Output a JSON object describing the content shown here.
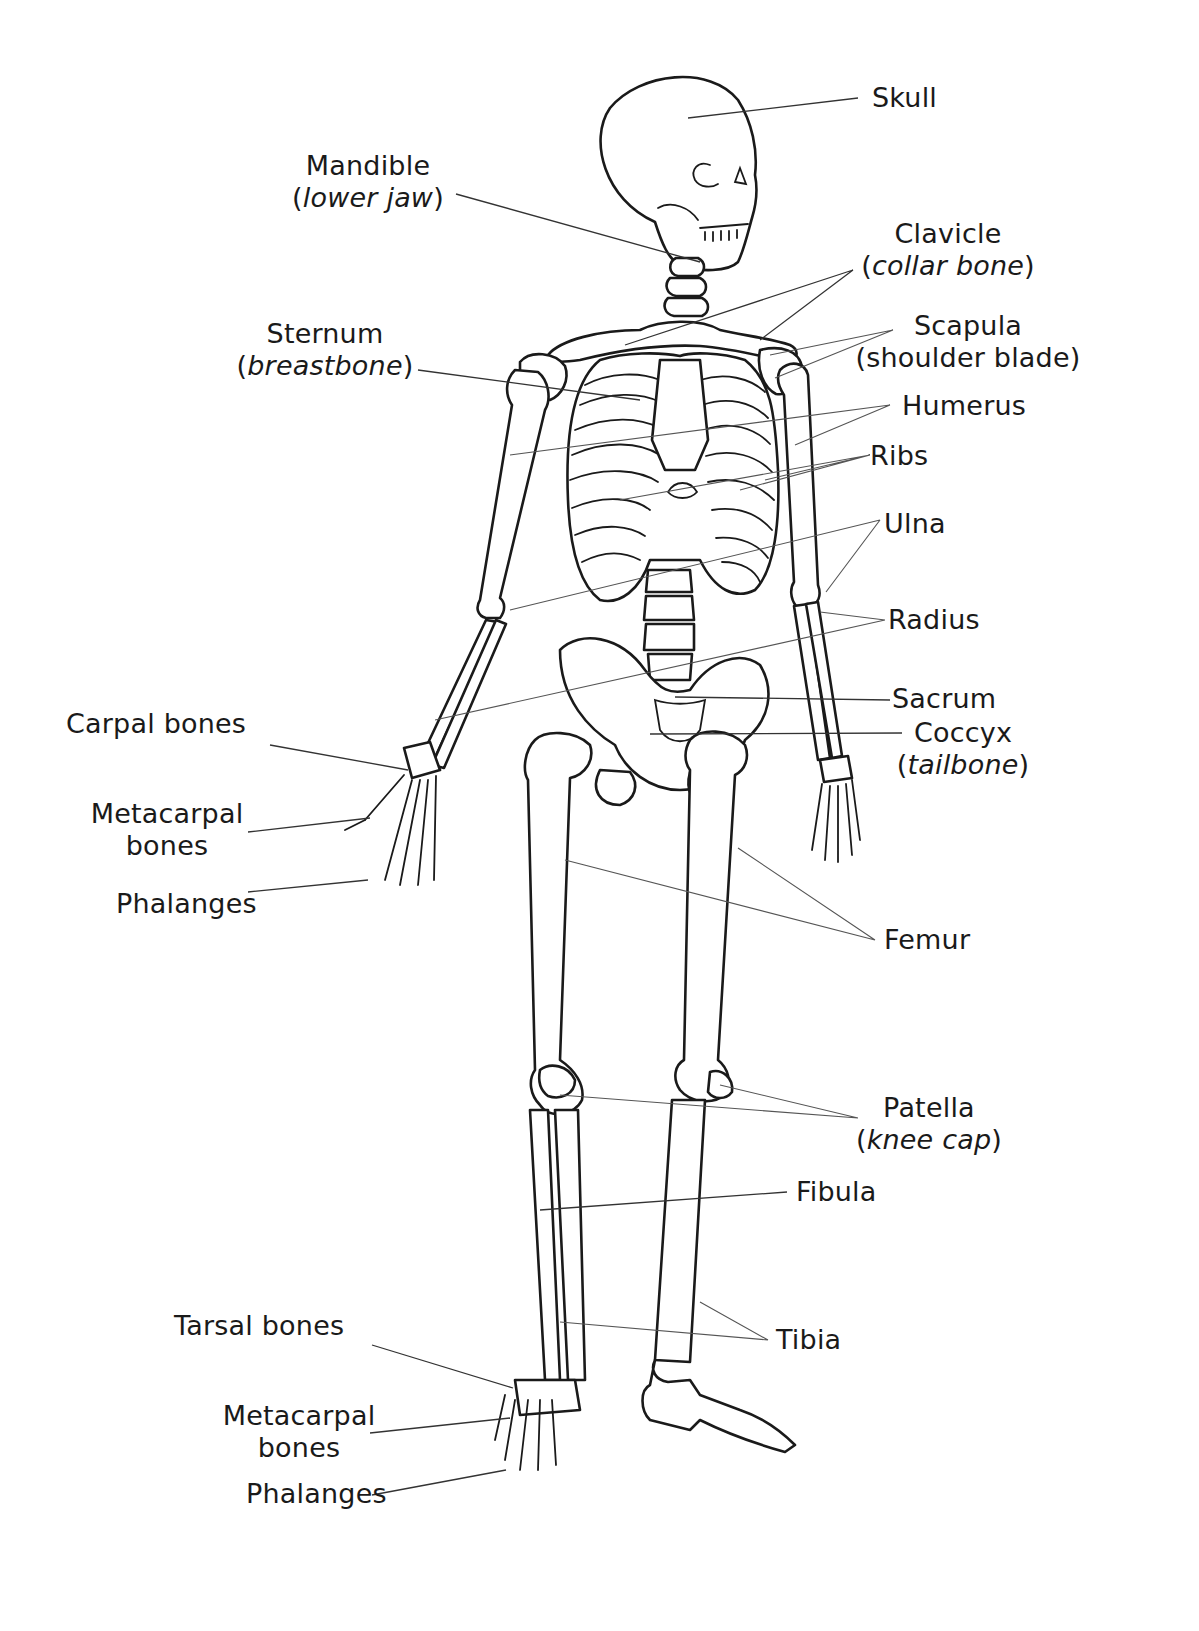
{
  "diagram": {
    "labels": {
      "skull": {
        "main": "Skull"
      },
      "mandible": {
        "main": "Mandible",
        "sub_open": "(",
        "sub_italic": "lower jaw",
        "sub_close": ")"
      },
      "clavicle": {
        "main": "Clavicle",
        "sub_open": "(",
        "sub_italic": "collar bone",
        "sub_close": ")"
      },
      "scapula": {
        "main": "Scapula",
        "sub": "(shoulder blade)"
      },
      "sternum": {
        "main": "Sternum",
        "sub_open": "(",
        "sub_italic": "breastbone",
        "sub_close": ")"
      },
      "humerus": {
        "main": "Humerus"
      },
      "ribs": {
        "main": "Ribs"
      },
      "ulna": {
        "main": "Ulna"
      },
      "radius": {
        "main": "Radius"
      },
      "sacrum": {
        "main": "Sacrum"
      },
      "coccyx": {
        "main": "Coccyx",
        "sub_open": "(",
        "sub_italic": "tailbone",
        "sub_close": ")"
      },
      "carpal": {
        "main": "Carpal bones"
      },
      "metacarpal_hand": {
        "main": "Metacarpal",
        "sub": "bones"
      },
      "phalanges_hand": {
        "main": "Phalanges"
      },
      "femur": {
        "main": "Femur"
      },
      "patella": {
        "main": "Patella",
        "sub_open": "(",
        "sub_italic": "knee cap",
        "sub_close": ")"
      },
      "fibula": {
        "main": "Fibula"
      },
      "tibia": {
        "main": "Tibia"
      },
      "tarsal": {
        "main": "Tarsal bones"
      },
      "metacarpal_foot": {
        "main": "Metacarpal",
        "sub": "bones"
      },
      "phalanges_foot": {
        "main": "Phalanges"
      }
    }
  }
}
